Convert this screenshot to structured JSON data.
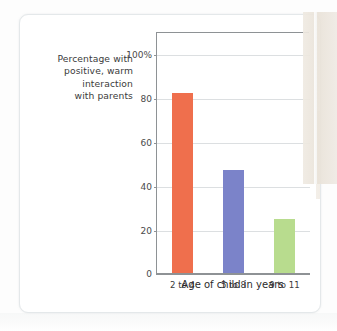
{
  "figure": {
    "background_color": "#ffffff",
    "border_color": "#e4e8ea"
  },
  "chart_data": {
    "type": "bar",
    "title": "",
    "subtitle": "",
    "categories": [
      "2 to 4",
      "5 to 8",
      "9 to 11"
    ],
    "values": [
      82,
      47,
      25
    ],
    "series": [
      {
        "name": "Percentage with positive, warm interaction with parents",
        "values": [
          82,
          47,
          25
        ],
        "colors": [
          "#ef6f4d",
          "#7b83c9",
          "#b8dc8e"
        ]
      }
    ],
    "xlabel": "Age of child in years",
    "ylabel": "Percentage with positive, warm interaction with parents",
    "ylim": [
      0,
      110
    ],
    "yticks": [
      0,
      20,
      40,
      60,
      80,
      100
    ],
    "ytick_labels": [
      "0",
      "20",
      "40",
      "60",
      "80",
      "100%"
    ],
    "grid": true,
    "grid_axis": "y",
    "legend": false,
    "legend_position": "none",
    "bar_colors": {
      "orange": "#ef6f4d",
      "blue": "#7b83c9",
      "green": "#b8dc8e"
    },
    "axis_color": "#8e9295",
    "gridline_color": "#dcdfe1"
  },
  "y_axis_caption_lines": [
    "Percentage with",
    "positive, warm",
    "interaction",
    "with parents"
  ],
  "x_axis_title": "Age of child in years"
}
